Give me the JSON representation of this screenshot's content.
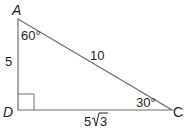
{
  "diagram": {
    "type": "right-triangle",
    "vertices": {
      "A": "A",
      "D": "D",
      "C": "C"
    },
    "angles": {
      "A": "60°",
      "C": "30°",
      "D": "90°"
    },
    "sides": {
      "AD": "5",
      "AC": "10",
      "DC_coef": "5",
      "DC_radicand": "3"
    },
    "colors": {
      "line": "#6d6e71",
      "text": "#231f20"
    }
  }
}
